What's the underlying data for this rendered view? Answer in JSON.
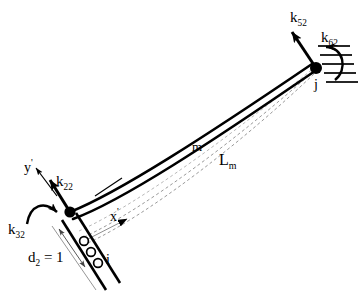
{
  "figure": {
    "type": "structural-beam-stiffness-diagram",
    "colors": {
      "stroke": "#000000",
      "background": "#ffffff",
      "dashed": "#8a8a8a"
    }
  },
  "nodes": [
    {
      "id": "i",
      "label": "i",
      "role": "start-node-roller-support",
      "x": 70,
      "y": 212
    },
    {
      "id": "j",
      "label": "j",
      "role": "end-node-fixed-support",
      "x": 316,
      "y": 68
    }
  ],
  "member": {
    "label": "m",
    "length_label": "L",
    "length_sub": "m",
    "description": "deformed member between node i and node j"
  },
  "axes": [
    {
      "name": "x-prime",
      "label": "x",
      "prime": "'",
      "orientation": "along-member-chord"
    },
    {
      "name": "y-prime",
      "label": "y",
      "prime": "'",
      "orientation": "perpendicular-to-member"
    }
  ],
  "displacement": {
    "name": "d2",
    "label": "d",
    "sub": "2",
    "equals": "= 1",
    "full_text": "d2 = 1"
  },
  "forces": [
    {
      "id": "k22",
      "label": "k",
      "sub": "22",
      "kind": "translational-force-arrow",
      "at_node": "i"
    },
    {
      "id": "k32",
      "label": "k",
      "sub": "32",
      "kind": "moment-arrow",
      "at_node": "i"
    },
    {
      "id": "k52",
      "label": "k",
      "sub": "52",
      "kind": "translational-force-arrow",
      "at_node": "j"
    },
    {
      "id": "k62",
      "label": "k",
      "sub": "62",
      "kind": "moment-arrow",
      "at_node": "j"
    }
  ],
  "supports": [
    {
      "at_node": "i",
      "type": "roller",
      "roller_count": 3
    },
    {
      "at_node": "j",
      "type": "fixed-hatched",
      "hatch_count": 5
    }
  ]
}
